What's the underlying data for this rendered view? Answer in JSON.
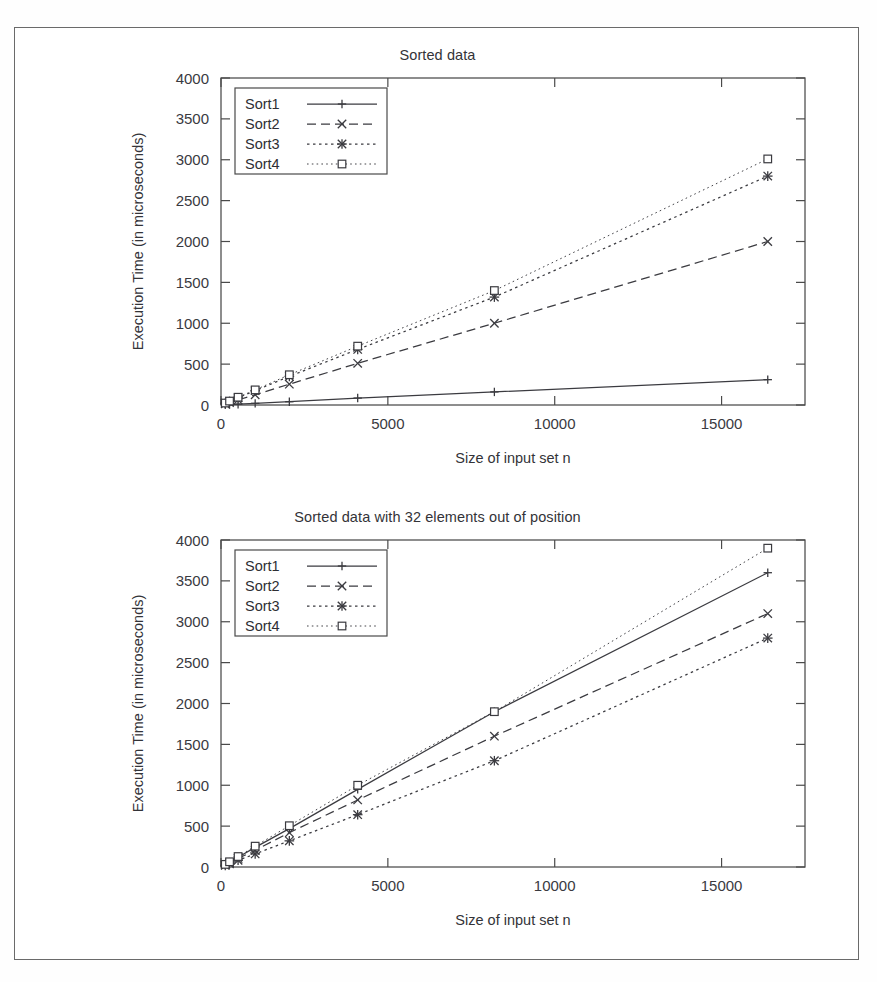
{
  "page": {
    "top_cut_text": "",
    "border_color": "#6a6a6a"
  },
  "axis_label_x": "Size of input set n",
  "axis_label_y": "Execution Time (in microseconds)",
  "legend_labels": [
    "Sort1",
    "Sort2",
    "Sort3",
    "Sort4"
  ],
  "chart_data": [
    {
      "type": "line",
      "title": "Sorted data",
      "xlabel": "Size of input set n",
      "ylabel": "Execution Time (in microseconds)",
      "xlim": [
        0,
        17500
      ],
      "ylim": [
        0,
        4000
      ],
      "xticks": [
        0,
        5000,
        10000,
        15000
      ],
      "yticks": [
        0,
        500,
        1000,
        1500,
        2000,
        2500,
        3000,
        3500,
        4000
      ],
      "xticklabels": [
        "0",
        "5000",
        "10000",
        "15000"
      ],
      "yticklabels": [
        "0",
        "500",
        "1000",
        "1500",
        "2000",
        "2500",
        "3000",
        "3500",
        "4000"
      ],
      "grid": false,
      "legend_position": "upper left",
      "x": [
        128,
        256,
        512,
        1024,
        2048,
        4096,
        8192,
        16384
      ],
      "series": [
        {
          "name": "Sort1",
          "marker": "plus",
          "dash": "solid",
          "values": [
            3,
            5,
            10,
            20,
            40,
            85,
            160,
            310
          ]
        },
        {
          "name": "Sort2",
          "marker": "cross",
          "dash": "dashed",
          "values": [
            15,
            30,
            62,
            125,
            255,
            510,
            1000,
            2000
          ]
        },
        {
          "name": "Sort3",
          "marker": "star",
          "dash": "dotted",
          "values": [
            22,
            44,
            88,
            175,
            350,
            680,
            1320,
            2800
          ]
        },
        {
          "name": "Sort4",
          "marker": "square",
          "dash": "finedot",
          "values": [
            24,
            48,
            95,
            185,
            370,
            720,
            1400,
            3010
          ]
        }
      ]
    },
    {
      "type": "line",
      "title": "Sorted data with 32 elements out of position",
      "xlabel": "Size of input set n",
      "ylabel": "Execution Time (in microseconds)",
      "xlim": [
        0,
        17500
      ],
      "ylim": [
        0,
        4000
      ],
      "xticks": [
        0,
        5000,
        10000,
        15000
      ],
      "yticks": [
        0,
        500,
        1000,
        1500,
        2000,
        2500,
        3000,
        3500,
        4000
      ],
      "xticklabels": [
        "0",
        "5000",
        "10000",
        "15000"
      ],
      "yticklabels": [
        "0",
        "500",
        "1000",
        "1500",
        "2000",
        "2500",
        "3000",
        "3500",
        "4000"
      ],
      "grid": false,
      "legend_position": "upper left",
      "x": [
        128,
        256,
        512,
        1024,
        2048,
        4096,
        8192,
        16384
      ],
      "series": [
        {
          "name": "Sort1",
          "marker": "plus",
          "dash": "solid",
          "values": [
            30,
            60,
            120,
            240,
            470,
            950,
            1900,
            3600
          ]
        },
        {
          "name": "Sort2",
          "marker": "cross",
          "dash": "dashed",
          "values": [
            25,
            52,
            105,
            205,
            420,
            820,
            1600,
            3100
          ]
        },
        {
          "name": "Sort3",
          "marker": "star",
          "dash": "dotted",
          "values": [
            20,
            40,
            82,
            160,
            320,
            640,
            1300,
            2800
          ]
        },
        {
          "name": "Sort4",
          "marker": "square",
          "dash": "finedot",
          "values": [
            32,
            64,
            128,
            255,
            505,
            1000,
            1900,
            3900
          ]
        }
      ]
    }
  ]
}
